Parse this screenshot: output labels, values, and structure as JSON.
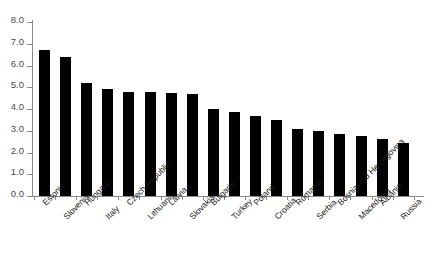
{
  "chart_data": {
    "type": "bar",
    "title": "",
    "subtitle": "",
    "xlabel": "",
    "ylabel": "",
    "ylim": [
      0.0,
      8.0
    ],
    "ytick_labels": [
      "8.0",
      "7.0",
      "6.0",
      "5.0",
      "4.0",
      "3.0",
      "2.0",
      "1.0",
      "0.0"
    ],
    "ytick_values": [
      8.0,
      7.0,
      6.0,
      5.0,
      4.0,
      3.0,
      2.0,
      1.0,
      0.0
    ],
    "grid": false,
    "legend": null,
    "bar_color": "#000000",
    "axis_color": "#8a8a8a",
    "categories": [
      "Estonia",
      "Slovenia",
      "Hungary",
      "Italy",
      "Czech Republic",
      "Lithuania",
      "Latvia",
      "Slovakia",
      "Bulgaria",
      "Turkey",
      "Poland",
      "Croatia",
      "Romania",
      "Serbia",
      "Bosnia and Herzegovina",
      "Macedonia",
      "Albania",
      "Russia"
    ],
    "values": [
      6.7,
      6.4,
      5.2,
      4.9,
      4.8,
      4.8,
      4.75,
      4.7,
      4.0,
      3.85,
      3.7,
      3.5,
      3.1,
      3.0,
      2.85,
      2.75,
      2.6,
      2.45
    ]
  }
}
